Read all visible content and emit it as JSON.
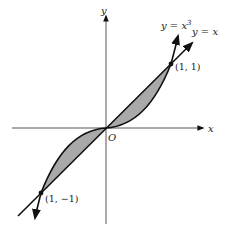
{
  "diagram": {
    "axes": {
      "x_label": "x",
      "y_label": "y",
      "origin_label": "O"
    },
    "curves": [
      {
        "name": "cubic",
        "label": "y = x",
        "label_sup": "3"
      },
      {
        "name": "line",
        "label": "y = x"
      }
    ],
    "points": [
      {
        "label": "(1, 1)"
      },
      {
        "label": "(1, −1)"
      }
    ],
    "colors": {
      "stroke": "#111111",
      "shade": "#a9a9a9",
      "background": "#ffffff"
    }
  }
}
